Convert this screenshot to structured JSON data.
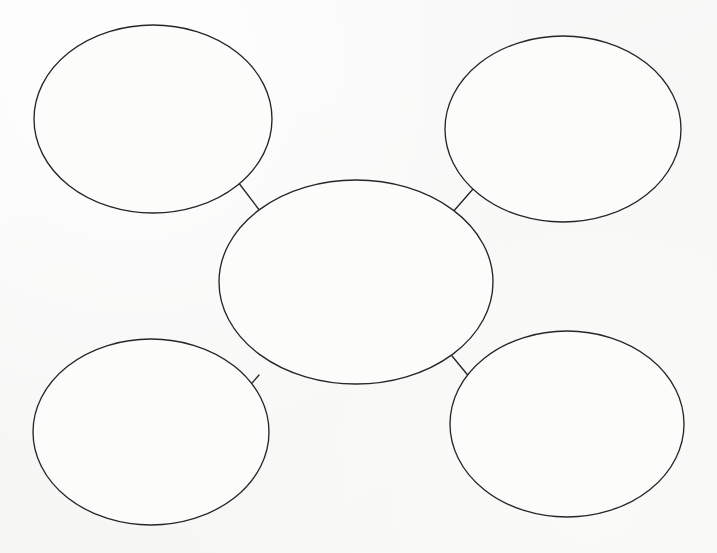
{
  "document": {
    "title": "Bubble Map Graphic Organizer",
    "type": "blank-concept-map-worksheet",
    "background_color": "#f8f8f7",
    "stroke_color": "#26262a",
    "fill_color": "#fcfcfb",
    "width": 717,
    "height": 553
  },
  "diagram": {
    "kind": "bubble-map",
    "node_count": 5,
    "connector_count": 4,
    "nodes": [
      {
        "id": "center",
        "role": "central-topic",
        "label": "",
        "cx": 356,
        "cy": 282,
        "rx": 137,
        "ry": 102
      },
      {
        "id": "top-left",
        "role": "detail",
        "label": "",
        "cx": 153,
        "cy": 119,
        "rx": 119,
        "ry": 94
      },
      {
        "id": "top-right",
        "role": "detail",
        "label": "",
        "cx": 563,
        "cy": 129,
        "rx": 118,
        "ry": 93
      },
      {
        "id": "bottom-left",
        "role": "detail",
        "label": "",
        "cx": 151,
        "cy": 432,
        "rx": 118,
        "ry": 93
      },
      {
        "id": "bottom-right",
        "role": "detail",
        "label": "",
        "cx": 567,
        "cy": 424,
        "rx": 117,
        "ry": 93
      }
    ],
    "connectors": [
      {
        "id": "connector-top-left",
        "from": "top-left",
        "to": "center",
        "x1": 238,
        "y1": 182,
        "x2": 260,
        "y2": 211
      },
      {
        "id": "connector-top-right",
        "from": "top-right",
        "to": "center",
        "x1": 473,
        "y1": 189,
        "x2": 452,
        "y2": 213
      },
      {
        "id": "connector-bottom-left",
        "from": "bottom-left",
        "to": "center",
        "x1": 259,
        "y1": 375,
        "x2": 240,
        "y2": 397
      },
      {
        "id": "connector-bottom-right",
        "from": "bottom-right",
        "to": "center",
        "x1": 452,
        "y1": 356,
        "x2": 471,
        "y2": 379
      }
    ]
  },
  "accessibility": {
    "alt_text": "Blank bubble map graphic organizer: a large central oval connected by four short lines to four surrounding ovals positioned at the upper left, upper right, lower left and lower right."
  }
}
